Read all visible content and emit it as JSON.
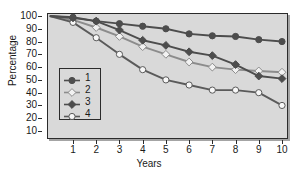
{
  "chart_data": {
    "type": "line",
    "title": "",
    "xlabel": "Years",
    "ylabel": "Percentage",
    "x": [
      0,
      1,
      2,
      3,
      4,
      5,
      6,
      7,
      8,
      9,
      10
    ],
    "xticks": [
      1,
      2,
      3,
      4,
      5,
      6,
      7,
      8,
      9,
      10
    ],
    "yticks": [
      10,
      20,
      30,
      40,
      50,
      60,
      70,
      80,
      90,
      100
    ],
    "xlim": [
      0,
      10
    ],
    "ylim": [
      0,
      104
    ],
    "grid": false,
    "legend_position": "inside-left",
    "series": [
      {
        "name": "1",
        "marker": "filled-circle",
        "color": "#4d4d4d",
        "marker_fill": "#4d4d4d",
        "values": [
          100,
          99,
          96,
          94,
          92,
          90,
          86,
          84.5,
          84,
          81.5,
          80
        ]
      },
      {
        "name": "2",
        "marker": "open-diamond",
        "color": "#8c8c8c",
        "marker_fill": "#f2f2f2",
        "values": [
          100,
          97,
          91,
          84,
          76,
          70,
          64,
          60,
          58,
          57,
          56
        ]
      },
      {
        "name": "3",
        "marker": "filled-diamond",
        "color": "#4d4d4d",
        "marker_fill": "#4d4d4d",
        "values": [
          100,
          98.5,
          96,
          89,
          81,
          77,
          72,
          69,
          62,
          53,
          51
        ]
      },
      {
        "name": "4",
        "marker": "open-circle",
        "color": "#5a5a5a",
        "marker_fill": "#f7f7f7",
        "values": [
          100,
          95,
          83,
          70,
          58,
          50,
          46,
          42,
          42,
          40,
          30
        ]
      }
    ]
  },
  "axes": {
    "y_title": "Percentage",
    "x_title": "Years",
    "y_tick_labels": [
      "100",
      "90",
      "80",
      "70",
      "60",
      "50",
      "40",
      "30",
      "20",
      "10"
    ],
    "x_tick_labels": [
      "1",
      "2",
      "3",
      "4",
      "5",
      "6",
      "7",
      "8",
      "9",
      "10"
    ]
  },
  "legend": {
    "entries": [
      {
        "label": "1"
      },
      {
        "label": "2"
      },
      {
        "label": "3"
      },
      {
        "label": "4"
      }
    ]
  },
  "colors": {
    "plot_background": "#d9d9d9",
    "page_background": "#ffffff",
    "axis": "#2b2b2b",
    "text": "#1a1a1a"
  }
}
